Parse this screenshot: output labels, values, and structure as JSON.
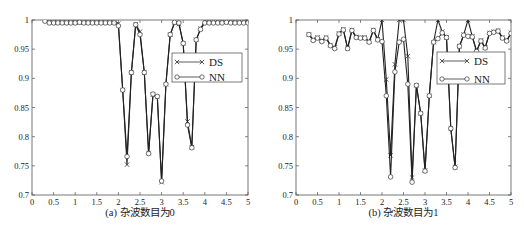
{
  "chart_data": [
    {
      "type": "line",
      "title": "",
      "caption": "(a) 杂波数目为0",
      "xlabel": "",
      "ylabel": "",
      "xlim": [
        0,
        5
      ],
      "ylim": [
        0.7,
        1.0
      ],
      "xticks": [
        0,
        0.5,
        1,
        1.5,
        2,
        2.5,
        3,
        3.5,
        4,
        4.5,
        5
      ],
      "xtick_labels": [
        "0",
        "0.5",
        "1",
        "1.5",
        "2",
        "2.5",
        "3",
        "3.5",
        "4",
        "4.5",
        "5"
      ],
      "yticks": [
        0.7,
        0.75,
        0.8,
        0.85,
        0.9,
        0.95,
        1.0
      ],
      "ytick_labels": [
        "0.7",
        "0.75",
        "0.8",
        "0.85",
        "0.9",
        "0.95",
        "1"
      ],
      "grid": false,
      "legend": {
        "position": "upper right (inside)",
        "entries": [
          "DS",
          "NN"
        ]
      },
      "series": [
        {
          "name": "DS",
          "marker": "x",
          "x": [
            0.3,
            0.4,
            0.5,
            0.6,
            0.7,
            0.8,
            0.9,
            1.0,
            1.1,
            1.2,
            1.3,
            1.4,
            1.5,
            1.6,
            1.7,
            1.8,
            1.9,
            2.0,
            2.1,
            2.2,
            2.3,
            2.4,
            2.5,
            2.6,
            2.7,
            2.8,
            2.9,
            3.0,
            3.1,
            3.2,
            3.3,
            3.4,
            3.5,
            3.6,
            3.7,
            3.8,
            3.9,
            4.0,
            4.1,
            4.2,
            4.3,
            4.4,
            4.5,
            4.6,
            4.7,
            4.8,
            4.9,
            5.0
          ],
          "y": [
            1.0,
            0.997,
            0.996,
            0.996,
            0.996,
            0.996,
            0.996,
            0.996,
            0.996,
            0.996,
            0.996,
            0.996,
            0.996,
            0.996,
            0.996,
            0.996,
            0.996,
            0.994,
            0.88,
            0.752,
            0.91,
            0.993,
            0.98,
            0.91,
            0.772,
            0.872,
            0.868,
            0.722,
            0.89,
            0.975,
            0.995,
            0.993,
            0.96,
            0.826,
            0.782,
            0.966,
            0.985,
            0.998,
            0.997,
            0.997,
            0.997,
            0.997,
            0.997,
            0.997,
            0.997,
            0.997,
            0.997,
            0.997
          ]
        },
        {
          "name": "NN",
          "marker": "o",
          "x": [
            0.3,
            0.4,
            0.5,
            0.6,
            0.7,
            0.8,
            0.9,
            1.0,
            1.1,
            1.2,
            1.3,
            1.4,
            1.5,
            1.6,
            1.7,
            1.8,
            1.9,
            2.0,
            2.1,
            2.2,
            2.3,
            2.4,
            2.5,
            2.6,
            2.7,
            2.8,
            2.9,
            3.0,
            3.1,
            3.2,
            3.3,
            3.4,
            3.5,
            3.6,
            3.7,
            3.8,
            3.9,
            4.0,
            4.1,
            4.2,
            4.3,
            4.4,
            4.5,
            4.6,
            4.7,
            4.8,
            4.9,
            5.0
          ],
          "y": [
            0.998,
            0.995,
            0.995,
            0.995,
            0.995,
            0.995,
            0.995,
            0.995,
            0.996,
            0.995,
            0.995,
            0.995,
            0.995,
            0.995,
            0.995,
            0.995,
            0.995,
            0.99,
            0.88,
            0.766,
            0.91,
            0.992,
            0.975,
            0.91,
            0.771,
            0.873,
            0.869,
            0.724,
            0.89,
            0.975,
            0.996,
            0.995,
            0.96,
            0.82,
            0.781,
            0.966,
            0.984,
            0.995,
            0.995,
            0.995,
            0.995,
            0.995,
            0.996,
            0.995,
            0.995,
            0.995,
            0.995,
            0.995
          ]
        }
      ]
    },
    {
      "type": "line",
      "title": "",
      "caption": "(b) 杂波数目为1",
      "xlabel": "",
      "ylabel": "",
      "xlim": [
        0,
        5
      ],
      "ylim": [
        0.7,
        1.0
      ],
      "xticks": [
        0,
        0.5,
        1,
        1.5,
        2,
        2.5,
        3,
        3.5,
        4,
        4.5,
        5
      ],
      "xtick_labels": [
        "0",
        "0.5",
        "1",
        "1.5",
        "2",
        "2.5",
        "3",
        "3.5",
        "4",
        "4.5",
        "5"
      ],
      "yticks": [
        0.7,
        0.75,
        0.8,
        0.85,
        0.9,
        0.95,
        1.0
      ],
      "ytick_labels": [
        "0.7",
        "0.75",
        "0.8",
        "0.85",
        "0.9",
        "0.95",
        "1"
      ],
      "grid": false,
      "legend": {
        "position": "upper right (inside)",
        "entries": [
          "DS",
          "NN"
        ]
      },
      "series": [
        {
          "name": "DS",
          "marker": "x",
          "x": [
            0.3,
            0.4,
            0.5,
            0.6,
            0.7,
            0.8,
            0.9,
            1.0,
            1.1,
            1.2,
            1.3,
            1.4,
            1.5,
            1.6,
            1.7,
            1.8,
            1.9,
            2.0,
            2.1,
            2.2,
            2.3,
            2.4,
            2.5,
            2.6,
            2.7,
            2.8,
            2.9,
            3.0,
            3.1,
            3.2,
            3.3,
            3.4,
            3.5,
            3.6,
            3.7,
            3.8,
            3.9,
            4.0,
            4.1,
            4.2,
            4.3,
            4.4,
            4.5,
            4.6,
            4.7,
            4.8,
            4.9,
            5.0
          ],
          "y": [
            0.975,
            0.967,
            0.97,
            0.965,
            0.97,
            0.957,
            0.953,
            0.977,
            0.984,
            0.952,
            0.983,
            0.971,
            0.97,
            0.97,
            0.963,
            0.983,
            0.967,
            1.0,
            0.898,
            0.768,
            0.924,
            1.0,
            1.0,
            0.938,
            0.73,
            0.888,
            0.84,
            0.742,
            0.87,
            0.962,
            1.0,
            0.98,
            0.97,
            0.814,
            0.748,
            0.955,
            0.975,
            1.0,
            0.972,
            0.947,
            0.965,
            0.953,
            0.978,
            0.98,
            0.982,
            0.97,
            0.965,
            0.978
          ]
        },
        {
          "name": "NN",
          "marker": "o",
          "x": [
            0.3,
            0.4,
            0.5,
            0.6,
            0.7,
            0.8,
            0.9,
            1.0,
            1.1,
            1.2,
            1.3,
            1.4,
            1.5,
            1.6,
            1.7,
            1.8,
            1.9,
            2.0,
            2.1,
            2.2,
            2.3,
            2.4,
            2.5,
            2.6,
            2.7,
            2.8,
            2.9,
            3.0,
            3.1,
            3.2,
            3.3,
            3.4,
            3.5,
            3.6,
            3.7,
            3.8,
            3.9,
            4.0,
            4.1,
            4.2,
            4.3,
            4.4,
            4.5,
            4.6,
            4.7,
            4.8,
            4.9,
            5.0
          ],
          "y": [
            0.975,
            0.965,
            0.969,
            0.963,
            0.969,
            0.956,
            0.951,
            0.976,
            0.983,
            0.951,
            0.982,
            0.97,
            0.969,
            0.969,
            0.962,
            0.982,
            0.966,
            0.963,
            0.87,
            0.731,
            0.911,
            0.962,
            0.967,
            0.89,
            0.722,
            0.888,
            0.84,
            0.741,
            0.87,
            0.962,
            0.968,
            0.978,
            0.97,
            0.814,
            0.747,
            0.955,
            0.974,
            0.972,
            0.971,
            0.946,
            0.964,
            0.952,
            0.977,
            0.979,
            0.981,
            0.969,
            0.964,
            0.977
          ]
        }
      ]
    }
  ]
}
